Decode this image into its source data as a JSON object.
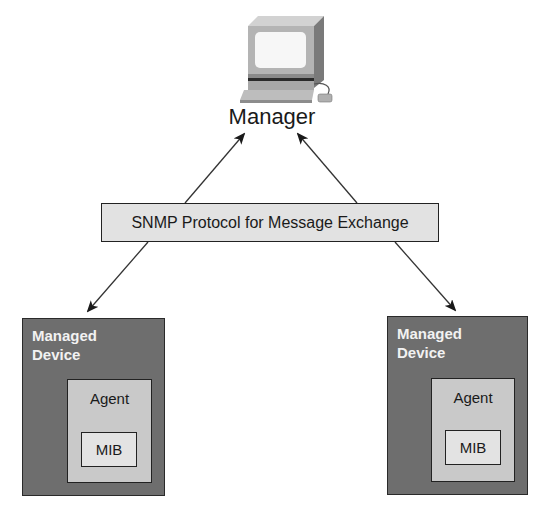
{
  "diagram": {
    "manager": {
      "label": "Manager",
      "icon": "computer-workstation-icon"
    },
    "protocol": {
      "label": "SNMP Protocol for Message Exchange"
    },
    "devices": [
      {
        "title_line1": "Managed",
        "title_line2": "Device",
        "agent_label": "Agent",
        "mib_label": "MIB"
      },
      {
        "title_line1": "Managed",
        "title_line2": "Device",
        "agent_label": "Agent",
        "mib_label": "MIB"
      }
    ],
    "connections": [
      {
        "from": "protocol",
        "to": "manager",
        "direction": "up-left"
      },
      {
        "from": "protocol",
        "to": "manager",
        "direction": "up-right"
      },
      {
        "from": "protocol",
        "to": "device-left"
      },
      {
        "from": "protocol",
        "to": "device-right"
      }
    ],
    "colors": {
      "device_fill": "#6e6e6e",
      "agent_fill": "#c9c9c9",
      "mib_fill": "#e3e3e3",
      "protocol_fill": "#e2e2e2",
      "stroke": "#222222"
    }
  }
}
